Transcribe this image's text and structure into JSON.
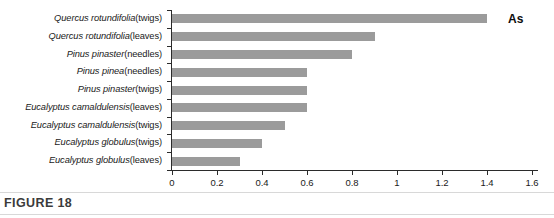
{
  "figure": {
    "caption": "FIGURE 18",
    "series_label": "As"
  },
  "chart_data": {
    "type": "bar",
    "orientation": "horizontal",
    "title": "",
    "xlabel": "",
    "ylabel": "",
    "xlim": [
      0,
      1.6
    ],
    "grid": false,
    "legend_position": "top-right",
    "series_name": "As",
    "bar_color": "#9b9b9b",
    "axis_color": "#2b2b2b",
    "xticks": [
      "0",
      "0.2",
      "0.4",
      "0.6",
      "0.8",
      "1",
      "1.2",
      "1.4",
      "1.6"
    ],
    "xtick_values": [
      0,
      0.2,
      0.4,
      0.6,
      0.8,
      1,
      1.2,
      1.4,
      1.6
    ],
    "categories": [
      "Quercus rotundifolia (twigs)",
      "Quercus rotundifolia (leaves)",
      "Pinus pinaster (needles)",
      "Pinus pinea (needles)",
      "Pinus pinaster (twigs)",
      "Eucalyptus camaldulensis (leaves)",
      "Eucalyptus camaldulensis (twigs)",
      "Eucalyptus globulus (twigs)",
      "Eucalyptus globulus (leaves)"
    ],
    "category_parts": [
      {
        "sci": "Quercus rotundifolia",
        "part": " (twigs)"
      },
      {
        "sci": "Quercus rotundifolia",
        "part": " (leaves)"
      },
      {
        "sci": "Pinus pinaster",
        "part": " (needles)"
      },
      {
        "sci": "Pinus pinea",
        "part": " (needles)"
      },
      {
        "sci": "Pinus pinaster",
        "part": " (twigs)"
      },
      {
        "sci": "Eucalyptus camaldulensis",
        "part": " (leaves)"
      },
      {
        "sci": "Eucalyptus camaldulensis",
        "part": " (twigs)"
      },
      {
        "sci": "Eucalyptus globulus",
        "part": " (twigs)"
      },
      {
        "sci": "Eucalyptus globulus",
        "part": " (leaves)"
      }
    ],
    "values": [
      1.4,
      0.9,
      0.8,
      0.6,
      0.6,
      0.6,
      0.5,
      0.4,
      0.3
    ]
  }
}
